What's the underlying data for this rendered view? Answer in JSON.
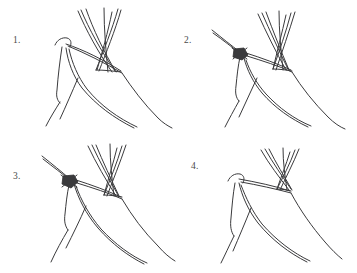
{
  "figure": {
    "background_color": "#ffffff",
    "line_color": "#3a3a3c",
    "knot_color": "#3a3a3c",
    "panel_count": 4,
    "layout": "2x2 grid"
  },
  "panels": [
    {
      "number": "1.",
      "caption": "",
      "has_knot": false,
      "description": "Three crossed poles with draped cover, no lashing"
    },
    {
      "number": "2.",
      "caption": "",
      "has_knot": true,
      "description": "Rope drawn from upper left, lashing knot tied at pole junction"
    },
    {
      "number": "3.",
      "caption": "",
      "has_knot": true,
      "description": "Lashing knot with poles splayed and rope extending to left"
    },
    {
      "number": "4.",
      "caption": "",
      "has_knot": false,
      "description": "Completed assembly, poles crossed and cover hung"
    }
  ]
}
